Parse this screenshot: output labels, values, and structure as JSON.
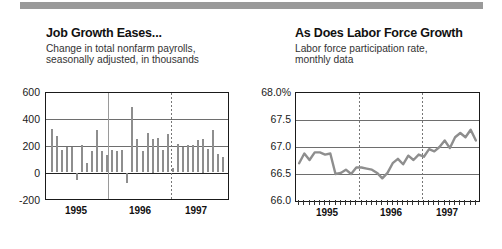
{
  "page": {
    "background": "#ffffff",
    "accent_gray": "#8e8e8e",
    "topbar_color": "#9a9a9a"
  },
  "charts": [
    {
      "id": "job-growth",
      "title": "Job Growth Eases...",
      "subtitle_line1": "Change in total nonfarm payrolls,",
      "subtitle_line2": "seasonally adjusted, in thousands",
      "ylabels": [
        "600",
        "400",
        "200",
        "0",
        "-200"
      ],
      "xlabels": [
        "1995",
        "1996",
        "1997"
      ]
    },
    {
      "id": "labor-force",
      "title": "As Does Labor Force Growth",
      "subtitle_line1": "Labor force participation rate,",
      "subtitle_line2": "monthly data",
      "ylabels": [
        "68.0%",
        "67.5",
        "67.0",
        "66.5",
        "66.0"
      ],
      "xlabels": [
        "1995",
        "1996",
        "1997"
      ]
    }
  ],
  "chart_data": [
    {
      "type": "bar",
      "title": "Job Growth Eases...",
      "subtitle": "Change in total nonfarm payrolls, seasonally adjusted, in thousands",
      "xlabel": "",
      "ylabel": "thousands",
      "ylim": [
        -200,
        600
      ],
      "yticks": [
        -200,
        0,
        200,
        400,
        600
      ],
      "grid": true,
      "legend": "none",
      "color": "#8e8e8e",
      "xtick_labels": [
        "1995",
        "1996",
        "1997"
      ],
      "x": [
        "1994-09",
        "1994-10",
        "1994-11",
        "1994-12",
        "1995-01",
        "1995-02",
        "1995-03",
        "1995-04",
        "1995-05",
        "1995-06",
        "1995-07",
        "1995-08",
        "1995-09",
        "1995-10",
        "1995-11",
        "1995-12",
        "1996-01",
        "1996-02",
        "1996-03",
        "1996-04",
        "1996-05",
        "1996-06",
        "1996-07",
        "1996-08",
        "1996-09",
        "1996-10",
        "1996-11",
        "1996-12",
        "1997-01",
        "1997-02",
        "1997-03",
        "1997-04",
        "1997-05",
        "1997-06",
        "1997-07"
      ],
      "values": [
        330,
        275,
        170,
        190,
        190,
        -60,
        205,
        75,
        165,
        320,
        165,
        130,
        170,
        165,
        170,
        -80,
        495,
        255,
        160,
        295,
        250,
        260,
        170,
        290,
        35,
        215,
        195,
        210,
        205,
        245,
        250,
        180,
        320,
        140,
        120
      ]
    },
    {
      "type": "line",
      "title": "As Does Labor Force Growth",
      "subtitle": "Labor force participation rate, monthly data",
      "xlabel": "",
      "ylabel": "percent",
      "ylim": [
        66.0,
        68.0
      ],
      "yticks": [
        66.0,
        66.5,
        67.0,
        67.5,
        68.0
      ],
      "grid": true,
      "legend": "none",
      "color": "#8e8e8e",
      "xtick_labels": [
        "1995",
        "1996",
        "1997"
      ],
      "x": [
        "1994-09",
        "1994-10",
        "1994-11",
        "1994-12",
        "1995-01",
        "1995-02",
        "1995-03",
        "1995-04",
        "1995-05",
        "1995-06",
        "1995-07",
        "1995-08",
        "1995-09",
        "1995-10",
        "1995-11",
        "1995-12",
        "1996-01",
        "1996-02",
        "1996-03",
        "1996-04",
        "1996-05",
        "1996-06",
        "1996-07",
        "1996-08",
        "1996-09",
        "1996-10",
        "1996-11",
        "1996-12",
        "1997-01",
        "1997-02",
        "1997-03",
        "1997-04",
        "1997-05",
        "1997-06",
        "1997-07"
      ],
      "values": [
        66.7,
        66.88,
        66.76,
        66.9,
        66.9,
        66.86,
        66.88,
        66.5,
        66.52,
        66.58,
        66.5,
        66.62,
        66.62,
        66.6,
        66.58,
        66.52,
        66.42,
        66.52,
        66.7,
        66.78,
        66.68,
        66.84,
        66.76,
        66.86,
        66.82,
        66.96,
        66.92,
        67.0,
        67.12,
        66.98,
        67.18,
        67.26,
        67.18,
        67.32,
        67.12
      ]
    }
  ]
}
